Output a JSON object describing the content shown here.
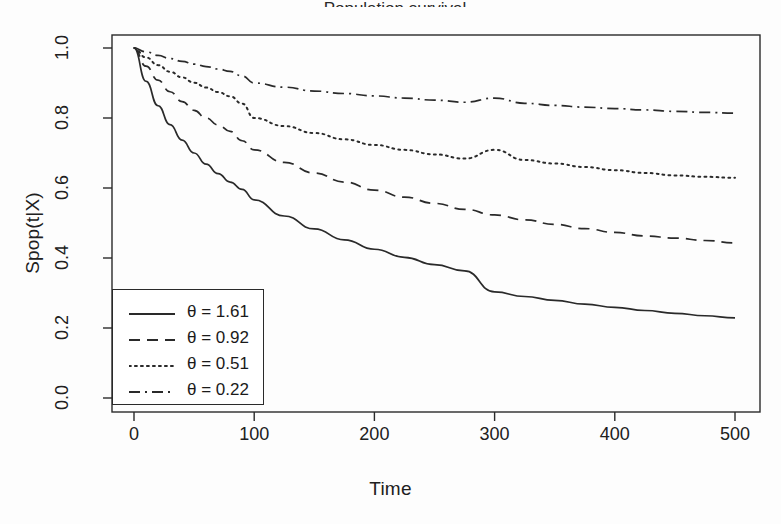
{
  "figure": {
    "background_color": "#fdfdfd",
    "line_color": "#2a2a2a",
    "title_fragment": "Population survival"
  },
  "chart_data": {
    "type": "line",
    "title": "",
    "xlabel": "Time",
    "ylabel": "Spop(t|X)",
    "xlim": [
      0,
      500
    ],
    "ylim": [
      0.0,
      1.0
    ],
    "xticks": [
      0,
      100,
      200,
      300,
      400,
      500
    ],
    "yticks": [
      0.0,
      0.2,
      0.4,
      0.6,
      0.8,
      1.0
    ],
    "xtick_labels": [
      "0",
      "100",
      "200",
      "300",
      "400",
      "500"
    ],
    "ytick_labels": [
      "0.0",
      "0.2",
      "0.4",
      "0.6",
      "0.8",
      "1.0"
    ],
    "grid": false,
    "legend_position": "bottom-left",
    "x": [
      0,
      10,
      20,
      30,
      40,
      50,
      60,
      70,
      80,
      90,
      100,
      125,
      150,
      175,
      200,
      225,
      250,
      275,
      300,
      325,
      350,
      375,
      400,
      425,
      450,
      475,
      500
    ],
    "series": [
      {
        "name": "θ = 1.61",
        "theta": 1.61,
        "linestyle": "solid",
        "values": [
          1.0,
          0.905,
          0.835,
          0.781,
          0.737,
          0.7,
          0.668,
          0.641,
          0.617,
          0.596,
          0.566,
          0.52,
          0.483,
          0.452,
          0.425,
          0.402,
          0.381,
          0.363,
          0.303,
          0.29,
          0.279,
          0.268,
          0.259,
          0.25,
          0.242,
          0.235,
          0.229
        ]
      },
      {
        "name": "θ = 0.92",
        "theta": 0.92,
        "linestyle": "dashed",
        "values": [
          1.0,
          0.948,
          0.908,
          0.875,
          0.847,
          0.822,
          0.8,
          0.78,
          0.762,
          0.735,
          0.709,
          0.673,
          0.643,
          0.617,
          0.594,
          0.574,
          0.556,
          0.539,
          0.523,
          0.509,
          0.496,
          0.484,
          0.473,
          0.463,
          0.457,
          0.45,
          0.443
        ]
      },
      {
        "name": "θ = 0.51",
        "theta": 0.51,
        "linestyle": "dotted",
        "values": [
          1.0,
          0.973,
          0.951,
          0.932,
          0.916,
          0.901,
          0.887,
          0.874,
          0.862,
          0.841,
          0.8,
          0.777,
          0.757,
          0.739,
          0.723,
          0.709,
          0.696,
          0.684,
          0.709,
          0.68,
          0.67,
          0.66,
          0.651,
          0.643,
          0.636,
          0.632,
          0.629
        ]
      },
      {
        "name": "θ = 0.22",
        "theta": 0.22,
        "linestyle": "dashdot",
        "values": [
          1.0,
          0.989,
          0.979,
          0.97,
          0.962,
          0.954,
          0.947,
          0.94,
          0.933,
          0.92,
          0.9,
          0.888,
          0.877,
          0.87,
          0.863,
          0.857,
          0.851,
          0.845,
          0.857,
          0.842,
          0.836,
          0.831,
          0.827,
          0.823,
          0.819,
          0.816,
          0.814
        ]
      }
    ]
  },
  "legend": {
    "entries": [
      {
        "label": "θ = 1.61",
        "style": "solid"
      },
      {
        "label": "θ = 0.92",
        "style": "dashed"
      },
      {
        "label": "θ = 0.51",
        "style": "dotted"
      },
      {
        "label": "θ = 0.22",
        "style": "dashdot"
      }
    ]
  }
}
